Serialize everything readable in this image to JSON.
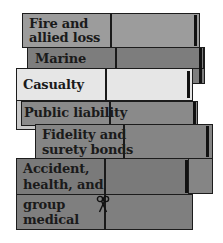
{
  "diagram": {
    "type": "stacked-insurance-policy-cards",
    "colors": {
      "fire": "#9c9c9c",
      "marine": "#7d7d7d",
      "casualty": "#e6e6e6",
      "public_liability": "#8a8a8a",
      "fidelity": "#858585",
      "accident": "#7a7a7a",
      "group_medical": "#7f7f7f",
      "border": "#1c1c1c"
    },
    "layers": [
      {
        "label": "Fire and\nallied loss",
        "line1": "Fire and",
        "line2": "allied loss"
      },
      {
        "label": "Marine"
      },
      {
        "label": "Casualty"
      },
      {
        "label": "Public liability"
      },
      {
        "label": "Fidelity and surety bonds",
        "line1": "Fidelity and",
        "line2": "surety bonds"
      },
      {
        "label": "Accident, health, and",
        "line1": "Accident,",
        "line2": "health, and"
      },
      {
        "label": "group medical",
        "line1": "group",
        "line2": "medical"
      }
    ],
    "icons": {
      "scissors": "scissors-icon"
    }
  }
}
